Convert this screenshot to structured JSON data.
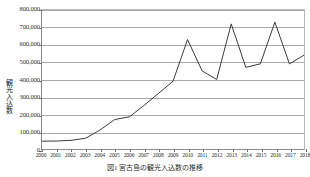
{
  "chart_data": {
    "type": "line",
    "title": "",
    "caption": "図1 宮古島の観光入込数の推移",
    "xlabel": "",
    "ylabel": "観光入込数",
    "x": [
      2000,
      2001,
      2002,
      2003,
      2004,
      2005,
      2006,
      2007,
      2008,
      2009,
      2010,
      2011,
      2012,
      2013,
      2014,
      2015,
      2016,
      2017,
      2018
    ],
    "xtick_labels": [
      "2000",
      "2001",
      "2002",
      "2003",
      "2004",
      "2005",
      "2006",
      "2007",
      "2008",
      "2009",
      "2010",
      "2011",
      "2012",
      "2013",
      "2014",
      "2015",
      "2016",
      "2017",
      "2018"
    ],
    "values": [
      45000,
      46000,
      50000,
      62000,
      110000,
      170000,
      185000,
      250000,
      320000,
      390000,
      630000,
      450000,
      400000,
      720000,
      470000,
      490000,
      730000,
      490000,
      540000
    ],
    "series": [
      {
        "name": "観光入込数",
        "color": "#3c3c3c",
        "values": [
          45000,
          46000,
          50000,
          62000,
          110000,
          170000,
          185000,
          250000,
          320000,
          390000,
          630000,
          450000,
          400000,
          720000,
          470000,
          490000,
          730000,
          490000,
          540000
        ]
      }
    ],
    "ylim": [
      0,
      800000
    ],
    "xlim": [
      2000,
      2018
    ],
    "ytick_values": [
      0,
      100000,
      200000,
      300000,
      400000,
      500000,
      600000,
      700000,
      800000
    ],
    "ytick_labels": [
      "0",
      "100,000",
      "200,000",
      "300,000",
      "400,000",
      "500,000",
      "600,000",
      "700,000",
      "800,000"
    ],
    "grid": true,
    "grid_axis": "y",
    "legend": false,
    "legend_position": "none",
    "markers": false,
    "line_width": 1
  },
  "colors": {
    "line": "#3c3c3c",
    "grid": "#a9a9a9",
    "axis": "#8a8a8a",
    "text": "#2b2b2b",
    "background": "#ffffff"
  }
}
